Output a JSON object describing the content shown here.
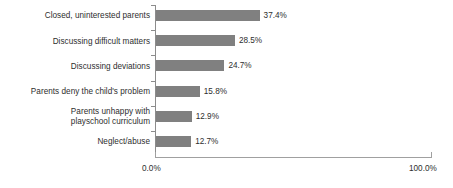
{
  "chart_data": {
    "type": "bar",
    "orientation": "horizontal",
    "title": "",
    "subtitle": "",
    "xlabel": "",
    "ylabel": "",
    "grid": false,
    "legend": false,
    "xlim": [
      0,
      100
    ],
    "xtick_labels": [
      "0.0%",
      "100.0%"
    ],
    "xtick_values": [
      0,
      100
    ],
    "value_suffix": "%",
    "bar_color": "#808080",
    "axis_color": "#8c8c8c",
    "text_color": "#2e2e2e",
    "categories": [
      "Closed, uninterested parents",
      "Discussing difficult matters",
      "Discussing deviations",
      "Parents deny the child's problem",
      "Parents unhappy with\nplayschool curriculum",
      "Neglect/abuse"
    ],
    "values": [
      37.4,
      28.5,
      24.7,
      15.8,
      12.9,
      12.7
    ],
    "value_labels": [
      "37.4%",
      "28.5%",
      "24.7%",
      "15.8%",
      "12.9%",
      "12.7%"
    ]
  }
}
